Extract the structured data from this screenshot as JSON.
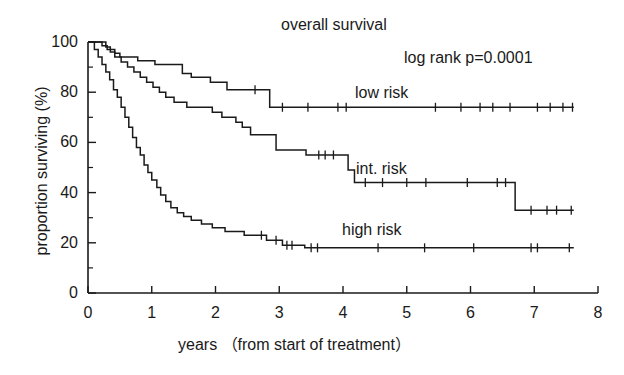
{
  "chart_data": {
    "type": "line",
    "title": "overall survival",
    "xlabel": "years （from start of treatment）",
    "ylabel": "proportion surviving (%)",
    "xlim": [
      0,
      8
    ],
    "ylim": [
      0,
      100
    ],
    "xticks": [
      0,
      1,
      2,
      3,
      4,
      5,
      6,
      7,
      8
    ],
    "xtick_labels": [
      "0",
      "1",
      "2",
      "3",
      "4",
      "5",
      "6",
      "7",
      "8"
    ],
    "yticks": [
      0,
      20,
      40,
      60,
      80,
      100
    ],
    "ytick_labels": [
      "0",
      "20",
      "40",
      "60",
      "80",
      "100"
    ],
    "y_minor_ticks": [
      10,
      30,
      50,
      70,
      90
    ],
    "grid": false,
    "legend_position": "inline-annotations",
    "annotations": [
      {
        "text": "log rank p=0.0001",
        "x": 4.95,
        "y": 90
      },
      {
        "text": "low risk",
        "x": 4.2,
        "y": 83
      },
      {
        "text": "int. risk",
        "x": 4.2,
        "y": 53
      },
      {
        "text": "high risk",
        "x": 4.0,
        "y": 29
      }
    ],
    "series": [
      {
        "name": "low risk",
        "final_survival": 74,
        "steps": [
          [
            0.0,
            100
          ],
          [
            0.22,
            100
          ],
          [
            0.22,
            98.5
          ],
          [
            0.3,
            98.5
          ],
          [
            0.3,
            97.0
          ],
          [
            0.42,
            97.0
          ],
          [
            0.42,
            95.5
          ],
          [
            0.5,
            95.5
          ],
          [
            0.5,
            94.0
          ],
          [
            0.78,
            94.0
          ],
          [
            0.78,
            92.5
          ],
          [
            1.05,
            92.5
          ],
          [
            1.05,
            91.0
          ],
          [
            1.48,
            91.0
          ],
          [
            1.48,
            87.5
          ],
          [
            1.62,
            87.5
          ],
          [
            1.62,
            86.0
          ],
          [
            1.92,
            86.0
          ],
          [
            1.92,
            84.0
          ],
          [
            2.18,
            84.0
          ],
          [
            2.18,
            81.0
          ],
          [
            2.85,
            81.0
          ],
          [
            2.85,
            74.0
          ],
          [
            7.62,
            74.0
          ]
        ],
        "censor_marks": [
          [
            2.62,
            81.0
          ],
          [
            3.05,
            74.0
          ],
          [
            3.45,
            74.0
          ],
          [
            3.92,
            74.0
          ],
          [
            4.05,
            74.0
          ],
          [
            5.45,
            74.0
          ],
          [
            5.85,
            74.0
          ],
          [
            6.15,
            74.0
          ],
          [
            6.35,
            74.0
          ],
          [
            6.62,
            74.0
          ],
          [
            7.05,
            74.0
          ],
          [
            7.25,
            74.0
          ],
          [
            7.45,
            74.0
          ],
          [
            7.6,
            74.0
          ]
        ]
      },
      {
        "name": "int. risk",
        "final_survival": 33,
        "steps": [
          [
            0.0,
            100
          ],
          [
            0.28,
            100
          ],
          [
            0.28,
            98.0
          ],
          [
            0.35,
            98.0
          ],
          [
            0.35,
            96.0
          ],
          [
            0.42,
            96.0
          ],
          [
            0.42,
            94.0
          ],
          [
            0.52,
            94.0
          ],
          [
            0.52,
            92.0
          ],
          [
            0.62,
            92.0
          ],
          [
            0.62,
            90.0
          ],
          [
            0.72,
            90.0
          ],
          [
            0.72,
            88.0
          ],
          [
            0.82,
            88.0
          ],
          [
            0.82,
            86.0
          ],
          [
            0.92,
            86.0
          ],
          [
            0.92,
            84.0
          ],
          [
            1.02,
            84.0
          ],
          [
            1.02,
            82.0
          ],
          [
            1.12,
            82.0
          ],
          [
            1.12,
            80.0
          ],
          [
            1.22,
            80.0
          ],
          [
            1.22,
            78.0
          ],
          [
            1.35,
            78.0
          ],
          [
            1.35,
            76.0
          ],
          [
            1.55,
            76.0
          ],
          [
            1.55,
            74.0
          ],
          [
            1.95,
            74.0
          ],
          [
            1.95,
            72.0
          ],
          [
            2.1,
            72.0
          ],
          [
            2.1,
            70.0
          ],
          [
            2.32,
            70.0
          ],
          [
            2.32,
            68.0
          ],
          [
            2.42,
            68.0
          ],
          [
            2.42,
            66.0
          ],
          [
            2.55,
            66.0
          ],
          [
            2.55,
            63.0
          ],
          [
            2.95,
            63.0
          ],
          [
            2.95,
            57.0
          ],
          [
            3.42,
            57.0
          ],
          [
            3.42,
            55.0
          ],
          [
            4.08,
            55.0
          ],
          [
            4.08,
            49.0
          ],
          [
            4.18,
            49.0
          ],
          [
            4.18,
            44.0
          ],
          [
            6.7,
            44.0
          ],
          [
            6.7,
            33.0
          ],
          [
            7.62,
            33.0
          ]
        ],
        "censor_marks": [
          [
            3.62,
            55.0
          ],
          [
            3.72,
            55.0
          ],
          [
            3.85,
            55.0
          ],
          [
            4.35,
            44.0
          ],
          [
            4.62,
            44.0
          ],
          [
            5.0,
            44.0
          ],
          [
            5.3,
            44.0
          ],
          [
            5.95,
            44.0
          ],
          [
            6.42,
            44.0
          ],
          [
            6.55,
            44.0
          ],
          [
            6.95,
            33.0
          ],
          [
            7.2,
            33.0
          ],
          [
            7.35,
            33.0
          ],
          [
            7.58,
            33.0
          ]
        ]
      },
      {
        "name": "high risk",
        "final_survival": 18,
        "steps": [
          [
            0.0,
            100
          ],
          [
            0.1,
            100
          ],
          [
            0.1,
            97.0
          ],
          [
            0.16,
            97.0
          ],
          [
            0.16,
            94.0
          ],
          [
            0.22,
            94.0
          ],
          [
            0.22,
            91.0
          ],
          [
            0.28,
            91.0
          ],
          [
            0.28,
            88.0
          ],
          [
            0.34,
            88.0
          ],
          [
            0.34,
            85.0
          ],
          [
            0.4,
            85.0
          ],
          [
            0.4,
            81.0
          ],
          [
            0.46,
            81.0
          ],
          [
            0.46,
            78.0
          ],
          [
            0.52,
            78.0
          ],
          [
            0.52,
            74.0
          ],
          [
            0.58,
            74.0
          ],
          [
            0.58,
            70.0
          ],
          [
            0.64,
            70.0
          ],
          [
            0.64,
            66.0
          ],
          [
            0.7,
            66.0
          ],
          [
            0.7,
            62.0
          ],
          [
            0.76,
            62.0
          ],
          [
            0.76,
            58.0
          ],
          [
            0.82,
            58.0
          ],
          [
            0.82,
            55.0
          ],
          [
            0.88,
            55.0
          ],
          [
            0.88,
            51.0
          ],
          [
            0.94,
            51.0
          ],
          [
            0.94,
            48.0
          ],
          [
            1.0,
            48.0
          ],
          [
            1.0,
            45.0
          ],
          [
            1.08,
            45.0
          ],
          [
            1.08,
            42.0
          ],
          [
            1.14,
            42.0
          ],
          [
            1.14,
            39.0
          ],
          [
            1.22,
            39.0
          ],
          [
            1.22,
            36.5
          ],
          [
            1.3,
            36.5
          ],
          [
            1.3,
            34.0
          ],
          [
            1.4,
            34.0
          ],
          [
            1.4,
            32.0
          ],
          [
            1.5,
            32.0
          ],
          [
            1.5,
            30.5
          ],
          [
            1.62,
            30.5
          ],
          [
            1.62,
            29.0
          ],
          [
            1.78,
            29.0
          ],
          [
            1.78,
            27.5
          ],
          [
            1.95,
            27.5
          ],
          [
            1.95,
            26.0
          ],
          [
            2.15,
            26.0
          ],
          [
            2.15,
            24.5
          ],
          [
            2.45,
            24.5
          ],
          [
            2.45,
            23.0
          ],
          [
            2.8,
            23.0
          ],
          [
            2.8,
            21.0
          ],
          [
            3.05,
            21.0
          ],
          [
            3.05,
            19.0
          ],
          [
            3.4,
            19.0
          ],
          [
            3.4,
            18.0
          ],
          [
            7.62,
            18.0
          ]
        ],
        "censor_marks": [
          [
            2.72,
            23.0
          ],
          [
            2.95,
            21.0
          ],
          [
            3.12,
            19.0
          ],
          [
            3.2,
            19.0
          ],
          [
            3.5,
            18.0
          ],
          [
            3.6,
            18.0
          ],
          [
            4.55,
            18.0
          ],
          [
            5.28,
            18.0
          ],
          [
            6.05,
            18.0
          ],
          [
            6.95,
            18.0
          ],
          [
            7.05,
            18.0
          ],
          [
            7.55,
            18.0
          ]
        ]
      }
    ]
  },
  "figure": {
    "title": "overall survival",
    "pvalue_text": "log rank p=0.0001",
    "y_axis_title": "proportion surviving (%)",
    "x_axis_title": "years （from start of treatment）",
    "series_labels": {
      "low": "low risk",
      "int": "int. risk",
      "high": "high risk"
    },
    "axis_color": "#1a1a1a",
    "curve_color": "#1a1a1a",
    "background": "#ffffff"
  }
}
